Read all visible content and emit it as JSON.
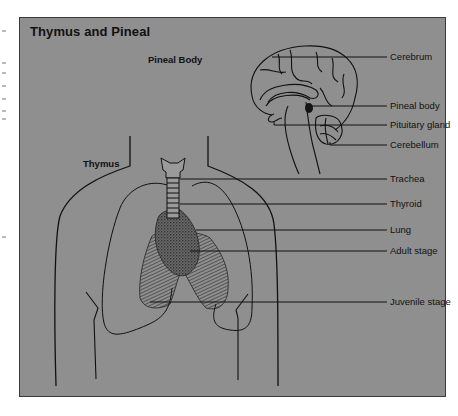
{
  "figure": {
    "title": "Thymus and Pineal",
    "panel_color": "#8f8f8f",
    "line_color": "#111111"
  },
  "pineal_section": {
    "heading": "Pineal Body",
    "labels": [
      {
        "text": "Cerebrum"
      },
      {
        "text": "Pineal body"
      },
      {
        "text": "Pituitary gland"
      },
      {
        "text": "Cerebellum"
      }
    ]
  },
  "thymus_section": {
    "heading": "Thymus",
    "labels": [
      {
        "text": "Trachea"
      },
      {
        "text": "Thyroid"
      },
      {
        "text": "Lung"
      },
      {
        "text": "Adult stage"
      },
      {
        "text": "Juvenile stage"
      }
    ]
  }
}
